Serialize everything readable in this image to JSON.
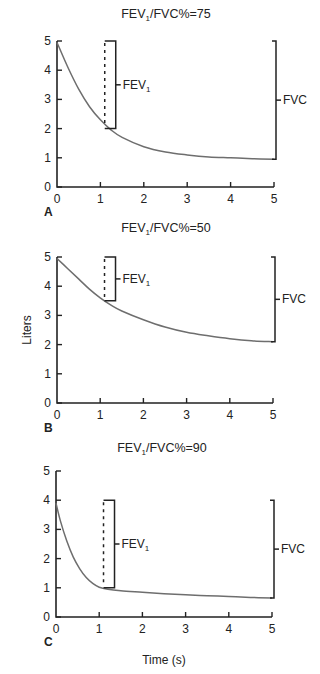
{
  "chart_data": [
    {
      "panel": "A",
      "type": "line",
      "title": "FEV1/FVC%=75",
      "title_main": "FEV",
      "title_sub": "1",
      "title_rest": "/FVC%=75",
      "xlabel": "",
      "ylabel": "",
      "xlim": [
        0,
        5
      ],
      "ylim": [
        0,
        5
      ],
      "xticks": [
        0,
        1,
        2,
        3,
        4,
        5
      ],
      "yticks": [
        0,
        1,
        2,
        3,
        4,
        5
      ],
      "grid": false,
      "series": [
        {
          "name": "Volume",
          "x": [
            0,
            0.25,
            0.5,
            0.75,
            1.0,
            1.25,
            1.5,
            2.0,
            2.5,
            3.0,
            3.5,
            4.0,
            4.5,
            5.0
          ],
          "values": [
            4.95,
            4.1,
            3.35,
            2.75,
            2.3,
            1.95,
            1.7,
            1.38,
            1.2,
            1.1,
            1.03,
            1.0,
            0.97,
            0.95
          ]
        }
      ],
      "annotations": {
        "fev1": {
          "label": "FEV",
          "sub": "1",
          "x": 1.1,
          "from": 5.0,
          "to": 2.0
        },
        "fvc": {
          "label": "FVC",
          "x": 5.0,
          "from": 5.0,
          "to": 0.95
        }
      }
    },
    {
      "panel": "B",
      "type": "line",
      "title": "FEV1/FVC%=50",
      "title_main": "FEV",
      "title_sub": "1",
      "title_rest": "/FVC%=50",
      "xlabel": "",
      "ylabel": "Liters",
      "xlim": [
        0,
        5
      ],
      "ylim": [
        0,
        5
      ],
      "xticks": [
        0,
        1,
        2,
        3,
        4,
        5
      ],
      "yticks": [
        0,
        1,
        2,
        3,
        4,
        5
      ],
      "grid": false,
      "series": [
        {
          "name": "Volume",
          "x": [
            0,
            0.25,
            0.5,
            0.75,
            1.0,
            1.25,
            1.5,
            2.0,
            2.5,
            3.0,
            3.5,
            4.0,
            4.5,
            5.0
          ],
          "values": [
            4.95,
            4.6,
            4.25,
            3.9,
            3.6,
            3.35,
            3.15,
            2.85,
            2.6,
            2.42,
            2.3,
            2.2,
            2.13,
            2.1
          ]
        }
      ],
      "annotations": {
        "fev1": {
          "label": "FEV",
          "sub": "1",
          "x": 1.1,
          "from": 5.0,
          "to": 3.5
        },
        "fvc": {
          "label": "FVC",
          "x": 5.0,
          "from": 5.0,
          "to": 2.1
        }
      }
    },
    {
      "panel": "C",
      "type": "line",
      "title": "FEV1/FVC%=90",
      "title_main": "FEV",
      "title_sub": "1",
      "title_rest": "/FVC%=90",
      "xlabel": "Time (s)",
      "ylabel": "",
      "xlim": [
        0,
        5
      ],
      "ylim": [
        0,
        5
      ],
      "xticks": [
        0,
        1,
        2,
        3,
        4,
        5
      ],
      "yticks": [
        0,
        1,
        2,
        3,
        4,
        5
      ],
      "grid": false,
      "series": [
        {
          "name": "Volume",
          "x": [
            0,
            0.1,
            0.25,
            0.4,
            0.55,
            0.7,
            0.85,
            1.0,
            1.2,
            1.5,
            2.0,
            2.5,
            3.0,
            3.5,
            4.0,
            4.5,
            5.0
          ],
          "values": [
            3.9,
            3.3,
            2.6,
            2.05,
            1.65,
            1.35,
            1.15,
            1.02,
            0.95,
            0.9,
            0.85,
            0.8,
            0.76,
            0.73,
            0.7,
            0.67,
            0.65
          ]
        }
      ],
      "annotations": {
        "fev1": {
          "label": "FEV",
          "sub": "1",
          "x": 1.1,
          "from": 4.0,
          "to": 1.0
        },
        "fvc": {
          "label": "FVC",
          "x": 5.0,
          "from": 4.0,
          "to": 0.65
        }
      }
    }
  ],
  "labels": {
    "ylabel": "Liters",
    "xlabel": "Time (s)",
    "fev_main": "FEV",
    "fev_sub": "1",
    "fvc": "FVC"
  }
}
